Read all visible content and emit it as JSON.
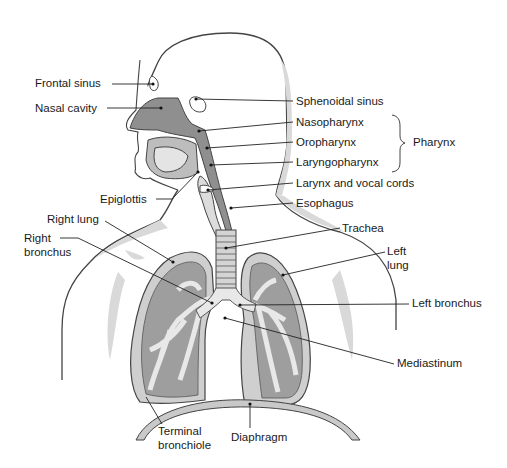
{
  "figure": {
    "colors": {
      "outline": "#3a3a3a",
      "body_shadow": "#d4d4d4",
      "airway_dark": "#8c8c8c",
      "airway_mid": "#b4b4b4",
      "airway_light": "#e6e6e6",
      "background": "#ffffff"
    }
  },
  "labels": {
    "frontal_sinus": "Frontal sinus",
    "nasal_cavity": "Nasal cavity",
    "sphenoidal_sinus": "Sphenoidal sinus",
    "nasopharynx": "Nasopharynx",
    "oropharynx": "Oropharynx",
    "laryngopharynx": "Laryngopharynx",
    "pharynx": "Pharynx",
    "larynx": "Larynx and vocal cords",
    "esophagus": "Esophagus",
    "epiglottis": "Epiglottis",
    "right_lung": "Right lung",
    "right_bronchus_1": "Right",
    "right_bronchus_2": "bronchus",
    "trachea": "Trachea",
    "left_lung_1": "Left",
    "left_lung_2": "lung",
    "left_bronchus": "Left bronchus",
    "mediastinum": "Mediastinum",
    "terminal_bronchiole_1": "Terminal",
    "terminal_bronchiole_2": "bronchiole",
    "diaphragm": "Diaphragm"
  }
}
